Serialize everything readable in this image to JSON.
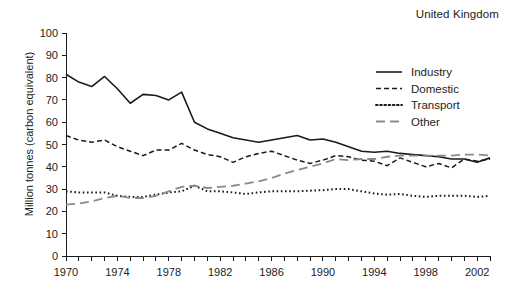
{
  "chart_data": {
    "type": "line",
    "title": "United Kingdom",
    "xlabel": "",
    "ylabel": "Million tonnes (carbon equivalent)",
    "ylim": [
      0,
      100
    ],
    "xlim": [
      1970,
      2003
    ],
    "y_ticks": [
      0,
      10,
      20,
      30,
      40,
      50,
      60,
      70,
      80,
      90,
      100
    ],
    "x_ticks": [
      1970,
      1971,
      1972,
      1973,
      1974,
      1975,
      1976,
      1977,
      1978,
      1979,
      1980,
      1981,
      1982,
      1983,
      1984,
      1985,
      1986,
      1987,
      1988,
      1989,
      1990,
      1991,
      1992,
      1993,
      1994,
      1995,
      1996,
      1997,
      1998,
      1999,
      2000,
      2001,
      2002,
      2003
    ],
    "x_tick_labels": [
      "1970",
      "1974",
      "1978",
      "1982",
      "1986",
      "1990",
      "1994",
      "1998",
      "2002"
    ],
    "x_tick_label_years": [
      1970,
      1974,
      1978,
      1982,
      1986,
      1990,
      1994,
      1998,
      2002
    ],
    "grid": false,
    "legend_position": "top-right",
    "x": [
      1970,
      1971,
      1972,
      1973,
      1974,
      1975,
      1976,
      1977,
      1978,
      1979,
      1980,
      1981,
      1982,
      1983,
      1984,
      1985,
      1986,
      1987,
      1988,
      1989,
      1990,
      1991,
      1992,
      1993,
      1994,
      1995,
      1996,
      1997,
      1998,
      1999,
      2000,
      2001,
      2002,
      2003
    ],
    "series": [
      {
        "name": "Industry",
        "style": "solid",
        "color": "#1a1a1a",
        "values": [
          81.5,
          78.0,
          76.0,
          80.5,
          75.0,
          68.5,
          72.5,
          72.0,
          70.0,
          73.5,
          60.0,
          57.0,
          55.0,
          53.0,
          52.0,
          51.0,
          52.0,
          53.0,
          54.0,
          52.0,
          52.5,
          51.0,
          49.0,
          47.0,
          46.5,
          47.0,
          46.0,
          45.5,
          45.0,
          44.5,
          43.5,
          43.5,
          42.0,
          44.0
        ]
      },
      {
        "name": "Domestic",
        "style": "dashed",
        "color": "#1a1a1a",
        "values": [
          54.0,
          52.0,
          51.0,
          52.0,
          49.0,
          47.0,
          45.0,
          47.5,
          47.5,
          50.5,
          47.5,
          45.5,
          44.5,
          42.0,
          44.5,
          46.0,
          47.0,
          45.0,
          43.0,
          41.5,
          43.0,
          45.0,
          44.5,
          43.0,
          42.5,
          40.5,
          44.0,
          42.0,
          40.0,
          41.5,
          39.5,
          43.5,
          42.5,
          43.5
        ]
      },
      {
        "name": "Transport",
        "style": "dotted",
        "color": "#1a1a1a",
        "values": [
          29.0,
          28.5,
          28.5,
          28.5,
          27.0,
          26.5,
          26.5,
          27.5,
          28.5,
          29.0,
          31.5,
          29.0,
          29.0,
          28.5,
          27.8,
          28.5,
          29.0,
          29.0,
          29.0,
          29.3,
          29.5,
          30.0,
          30.0,
          29.0,
          28.0,
          27.5,
          27.8,
          27.0,
          26.5,
          27.0,
          27.0,
          27.0,
          26.5,
          27.0
        ]
      },
      {
        "name": "Other",
        "style": "longdash",
        "color": "#8a8a8a",
        "values": [
          23.0,
          23.5,
          24.5,
          26.0,
          27.0,
          26.0,
          26.0,
          27.0,
          29.0,
          31.0,
          31.5,
          30.5,
          31.0,
          31.5,
          32.5,
          33.5,
          35.0,
          37.0,
          38.5,
          40.0,
          41.5,
          43.5,
          43.0,
          43.5,
          43.5,
          44.5,
          45.0,
          45.0,
          45.0,
          45.0,
          45.0,
          45.5,
          45.5,
          45.0
        ]
      }
    ]
  },
  "legend": {
    "items": [
      {
        "label": "Industry"
      },
      {
        "label": "Domestic"
      },
      {
        "label": "Transport"
      },
      {
        "label": "Other"
      }
    ]
  }
}
